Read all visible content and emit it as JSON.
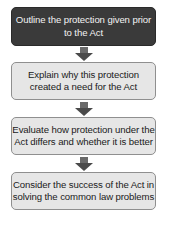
{
  "flowchart": {
    "steps": [
      {
        "label": "Outline the protection given prior to the Act",
        "style": "dark"
      },
      {
        "label": "Explain why this protection created a need for the Act",
        "style": "light"
      },
      {
        "label": "Evaluate how protection under the Act differs and whether it is better",
        "style": "light"
      },
      {
        "label": "Consider the success of the Act in solving the common law problems",
        "style": "light"
      }
    ],
    "arrow_icon": "down-arrow-icon",
    "colors": {
      "dark_box": "#3a3a3a",
      "light_box": "#e6e6e6",
      "arrow": "#555555"
    }
  }
}
